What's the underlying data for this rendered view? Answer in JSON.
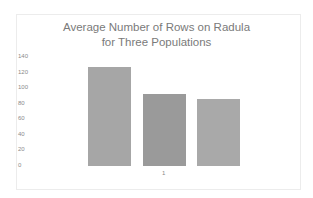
{
  "chart_data": {
    "type": "bar",
    "title": "Average Number of Rows on Radula for Three Populations",
    "title_lines": [
      "Average Number of Rows on Radula",
      "for Three Populations"
    ],
    "categories": [
      "1"
    ],
    "series": [
      {
        "name": "Population 1",
        "values": [
          127
        ],
        "color": "#a6a6a6"
      },
      {
        "name": "Population 2",
        "values": [
          92
        ],
        "color": "#9a9a9a"
      },
      {
        "name": "Population 3",
        "values": [
          86
        ],
        "color": "#a9a9a9"
      }
    ],
    "xlabel": "",
    "ylabel": "",
    "ylim": [
      0,
      140
    ],
    "yticks": [
      "140",
      "120",
      "100",
      "80",
      "60",
      "40",
      "20",
      "0"
    ],
    "grid": false,
    "legend": "none"
  }
}
